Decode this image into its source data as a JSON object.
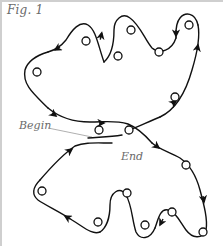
{
  "figure": {
    "title": "Fig. 1",
    "labels": {
      "begin": "Begin",
      "end": "End"
    },
    "colors": {
      "stroke": "#111111",
      "text": "#6a6a6a",
      "frame": "#cfcfcf",
      "leader": "#9a9a9a"
    },
    "upper_loop": {
      "direction": "counter-clockwise path with arrows",
      "circles": 8
    },
    "lower_loop": {
      "direction": "clockwise path with arrows",
      "circles": 7
    }
  }
}
